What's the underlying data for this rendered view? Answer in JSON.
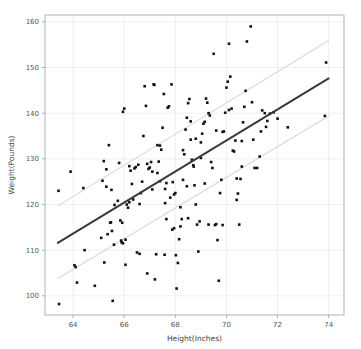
{
  "chart_data": {
    "type": "scatter",
    "title": "",
    "xlabel": "Height(Inches)",
    "ylabel": "Weight(Pounds)",
    "xlim": [
      62.9,
      74.6
    ],
    "ylim": [
      95.8,
      161.5
    ],
    "xticks": [
      64,
      66,
      68,
      70,
      72,
      74
    ],
    "yticks": [
      100,
      110,
      120,
      130,
      140,
      150,
      160
    ],
    "grid": true,
    "legend": null,
    "colors": {
      "point": "#111111",
      "fit_line": "#3a3a3a",
      "confidence_band": "#d8d8d8",
      "grid": "#e8e8ec",
      "frame": "#aaaaaa",
      "background": "#ffffff",
      "tick_label": "#555555",
      "axis_title": "#444444"
    },
    "marker": {
      "shape": "square",
      "size_px": 2.6
    },
    "fit_line": {
      "name": "linear regression",
      "x": [
        63.4,
        74.0
      ],
      "y": [
        111.6,
        147.6
      ],
      "slope": 3.4,
      "intercept": -103.9
    },
    "upper_band": {
      "name": "upper prediction band",
      "x": [
        63.4,
        74.0
      ],
      "y": [
        119.7,
        155.9
      ]
    },
    "lower_band": {
      "name": "lower prediction band",
      "x": [
        63.4,
        74.0
      ],
      "y": [
        103.8,
        139.4
      ]
    },
    "points": [
      [
        63.43,
        123.0
      ],
      [
        63.45,
        98.2
      ],
      [
        63.9,
        127.2
      ],
      [
        64.05,
        106.7
      ],
      [
        64.1,
        106.3
      ],
      [
        64.15,
        102.9
      ],
      [
        64.4,
        123.6
      ],
      [
        64.45,
        110.0
      ],
      [
        64.85,
        102.2
      ],
      [
        65.1,
        112.7
      ],
      [
        65.15,
        125.2
      ],
      [
        65.2,
        129.5
      ],
      [
        65.22,
        107.3
      ],
      [
        65.3,
        123.9
      ],
      [
        65.35,
        113.5
      ],
      [
        65.4,
        133.0
      ],
      [
        65.45,
        116.0
      ],
      [
        65.48,
        116.1
      ],
      [
        65.5,
        123.2
      ],
      [
        65.52,
        114.2
      ],
      [
        65.55,
        98.9
      ],
      [
        65.6,
        111.2
      ],
      [
        65.62,
        119.9
      ],
      [
        65.75,
        120.8
      ],
      [
        65.8,
        129.1
      ],
      [
        65.85,
        116.5
      ],
      [
        65.88,
        112.1
      ],
      [
        65.9,
        111.7
      ],
      [
        65.92,
        116.0
      ],
      [
        65.95,
        140.3
      ],
      [
        66.0,
        141.0
      ],
      [
        66.05,
        106.8
      ],
      [
        66.1,
        120.0
      ],
      [
        66.15,
        119.3
      ],
      [
        66.2,
        120.5
      ],
      [
        66.25,
        127.4
      ],
      [
        66.3,
        124.5
      ],
      [
        66.35,
        121.1
      ],
      [
        66.4,
        127.9
      ],
      [
        66.45,
        128.2
      ],
      [
        66.5,
        109.5
      ],
      [
        66.55,
        128.7
      ],
      [
        66.6,
        109.2
      ],
      [
        66.65,
        122.5
      ],
      [
        66.7,
        125.0
      ],
      [
        66.75,
        135.0
      ],
      [
        66.8,
        145.9
      ],
      [
        66.85,
        141.6
      ],
      [
        66.9,
        104.9
      ],
      [
        66.95,
        127.8
      ],
      [
        67.0,
        128.1
      ],
      [
        67.05,
        129.3
      ],
      [
        67.1,
        123.3
      ],
      [
        67.15,
        146.3
      ],
      [
        67.18,
        146.2
      ],
      [
        67.2,
        103.6
      ],
      [
        67.25,
        109.1
      ],
      [
        67.3,
        126.9
      ],
      [
        67.35,
        129.4
      ],
      [
        67.4,
        132.9
      ],
      [
        67.45,
        132.0
      ],
      [
        67.5,
        136.8
      ],
      [
        67.55,
        144.2
      ],
      [
        67.58,
        109.0
      ],
      [
        67.6,
        123.4
      ],
      [
        67.65,
        124.7
      ],
      [
        67.7,
        141.2
      ],
      [
        67.75,
        141.5
      ],
      [
        67.8,
        121.5
      ],
      [
        67.85,
        146.3
      ],
      [
        67.88,
        114.5
      ],
      [
        67.9,
        124.9
      ],
      [
        67.95,
        122.2
      ],
      [
        68.0,
        122.5
      ],
      [
        68.02,
        108.9
      ],
      [
        68.05,
        101.6
      ],
      [
        68.1,
        107.2
      ],
      [
        68.15,
        112.4
      ],
      [
        68.2,
        119.4
      ],
      [
        68.25,
        116.8
      ],
      [
        68.3,
        125.4
      ],
      [
        68.35,
        131.0
      ],
      [
        68.4,
        136.4
      ],
      [
        68.45,
        139.0
      ],
      [
        68.5,
        142.2
      ],
      [
        68.55,
        143.1
      ],
      [
        68.6,
        134.2
      ],
      [
        68.65,
        129.8
      ],
      [
        68.7,
        128.6
      ],
      [
        68.72,
        128.3
      ],
      [
        68.75,
        124.2
      ],
      [
        68.8,
        120.0
      ],
      [
        68.85,
        115.6
      ],
      [
        68.9,
        109.7
      ],
      [
        68.95,
        116.3
      ],
      [
        69.0,
        133.6
      ],
      [
        69.05,
        135.5
      ],
      [
        69.1,
        137.7
      ],
      [
        69.15,
        138.1
      ],
      [
        69.2,
        143.2
      ],
      [
        69.25,
        142.3
      ],
      [
        69.3,
        140.0
      ],
      [
        69.35,
        139.5
      ],
      [
        69.4,
        129.3
      ],
      [
        69.45,
        128.0
      ],
      [
        69.5,
        153.0
      ],
      [
        69.55,
        115.5
      ],
      [
        69.6,
        115.7
      ],
      [
        69.65,
        112.2
      ],
      [
        69.7,
        103.3
      ],
      [
        69.75,
        122.5
      ],
      [
        69.8,
        125.4
      ],
      [
        69.85,
        135.9
      ],
      [
        69.9,
        136.0
      ],
      [
        69.95,
        140.1
      ],
      [
        70.0,
        145.6
      ],
      [
        70.05,
        146.9
      ],
      [
        70.1,
        155.2
      ],
      [
        70.15,
        148.0
      ],
      [
        70.2,
        141.0
      ],
      [
        70.25,
        131.8
      ],
      [
        70.3,
        131.6
      ],
      [
        70.35,
        134.0
      ],
      [
        70.4,
        121.0
      ],
      [
        70.45,
        122.4
      ],
      [
        70.5,
        115.6
      ],
      [
        70.55,
        125.6
      ],
      [
        70.6,
        133.9
      ],
      [
        70.65,
        138.0
      ],
      [
        70.7,
        141.4
      ],
      [
        70.75,
        144.9
      ],
      [
        70.8,
        155.7
      ],
      [
        70.95,
        159.0
      ],
      [
        71.0,
        142.4
      ],
      [
        71.05,
        134.2
      ],
      [
        71.1,
        128.0
      ],
      [
        71.2,
        128.0
      ],
      [
        71.3,
        130.5
      ],
      [
        71.35,
        136.0
      ],
      [
        71.4,
        140.6
      ],
      [
        71.5,
        140.0
      ],
      [
        71.55,
        137.0
      ],
      [
        71.6,
        138.3
      ],
      [
        71.7,
        139.9
      ],
      [
        71.85,
        140.2
      ],
      [
        72.0,
        138.8
      ],
      [
        72.4,
        136.9
      ],
      [
        73.85,
        139.4
      ],
      [
        73.9,
        151.1
      ],
      [
        65.3,
        127.7
      ],
      [
        66.9,
        128.9
      ],
      [
        67.3,
        133.0
      ],
      [
        68.3,
        131.9
      ],
      [
        68.6,
        138.2
      ],
      [
        69.0,
        130.2
      ],
      [
        67.6,
        120.3
      ],
      [
        66.6,
        120.1
      ],
      [
        68.2,
        115.2
      ],
      [
        67.95,
        114.8
      ],
      [
        69.3,
        115.6
      ],
      [
        70.1,
        140.7
      ],
      [
        70.6,
        128.3
      ],
      [
        68.8,
        134.4
      ],
      [
        69.6,
        136.2
      ],
      [
        66.2,
        128.4
      ],
      [
        67.1,
        127.2
      ],
      [
        67.4,
        125.1
      ],
      [
        68.45,
        124.0
      ],
      [
        69.15,
        124.6
      ],
      [
        70.4,
        125.7
      ],
      [
        65.95,
        111.5
      ],
      [
        66.05,
        112.3
      ],
      [
        67.65,
        116.8
      ],
      [
        68.5,
        117.0
      ],
      [
        69.85,
        115.5
      ]
    ]
  },
  "axes": {
    "x_tick_labels": [
      "64",
      "66",
      "68",
      "70",
      "72",
      "74"
    ],
    "y_tick_labels": [
      "100",
      "110",
      "120",
      "130",
      "140",
      "150",
      "160"
    ],
    "xlabel": "Height(Inches)",
    "ylabel": "Weight(Pounds)"
  }
}
